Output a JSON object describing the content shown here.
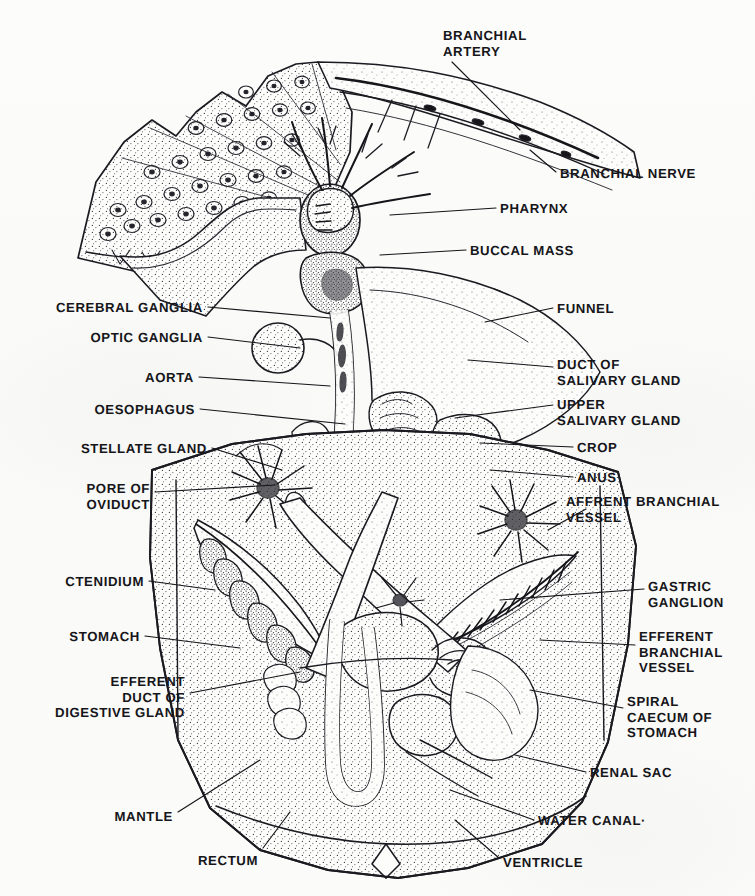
{
  "figure": {
    "kind": "anatomical-line-drawing",
    "style": "stippled pen-and-ink scan",
    "background_color": "#fbfbfa",
    "ink_color": "#15151a"
  },
  "labels": [
    {
      "id": "branchial-artery",
      "text": "BRANCHIAL\nARTERY",
      "x": 443,
      "y": 28,
      "align": "l"
    },
    {
      "id": "branchial-nerve",
      "text": "BRANCHIAL NERVE",
      "x": 560,
      "y": 166,
      "align": "l"
    },
    {
      "id": "pharynx",
      "text": "PHARYNX",
      "x": 500,
      "y": 201,
      "align": "l"
    },
    {
      "id": "buccal-mass",
      "text": "BUCCAL MASS",
      "x": 470,
      "y": 243,
      "align": "l"
    },
    {
      "id": "cerebral-ganglia",
      "text": "CEREBRAL GANGLIA",
      "x": 203,
      "y": 300,
      "align": "r"
    },
    {
      "id": "optic-ganglia",
      "text": "OPTIC GANGLIA",
      "x": 203,
      "y": 330,
      "align": "r"
    },
    {
      "id": "funnel",
      "text": "FUNNEL",
      "x": 557,
      "y": 301,
      "align": "l"
    },
    {
      "id": "duct-salivary",
      "text": "DUCT OF\nSALIVARY GLAND",
      "x": 557,
      "y": 357,
      "align": "l"
    },
    {
      "id": "aorta",
      "text": "AORTA",
      "x": 194,
      "y": 370,
      "align": "r"
    },
    {
      "id": "upper-salivary",
      "text": "UPPER\nSALIVARY GLAND",
      "x": 557,
      "y": 397,
      "align": "l"
    },
    {
      "id": "oesophagus",
      "text": "OESOPHAGUS",
      "x": 195,
      "y": 402,
      "align": "r"
    },
    {
      "id": "crop",
      "text": "CROP",
      "x": 577,
      "y": 440,
      "align": "l"
    },
    {
      "id": "stellate-gland",
      "text": "STELLATE GLAND",
      "x": 207,
      "y": 441,
      "align": "r"
    },
    {
      "id": "anus",
      "text": "ANUS",
      "x": 577,
      "y": 470,
      "align": "l"
    },
    {
      "id": "pore-of-oviduct",
      "text": "PORE OF\nOVIDUCT",
      "x": 150,
      "y": 481,
      "align": "r"
    },
    {
      "id": "afferent-branchial",
      "text": "AFFRENT BRANCHIAL\nVESSEL",
      "x": 566,
      "y": 494,
      "align": "l"
    },
    {
      "id": "ctenidium",
      "text": "CTENIDIUM",
      "x": 144,
      "y": 574,
      "align": "r"
    },
    {
      "id": "gastric-ganglion",
      "text": "GASTRIC\nGANGLION",
      "x": 648,
      "y": 579,
      "align": "l"
    },
    {
      "id": "stomach",
      "text": "STOMACH",
      "x": 140,
      "y": 629,
      "align": "r"
    },
    {
      "id": "efferent-branchial",
      "text": "EFFERENT\nBRANCHIAL\nVESSEL",
      "x": 639,
      "y": 629,
      "align": "l"
    },
    {
      "id": "efferent-duct",
      "text": "EFFERENT\nDUCT OF\nDIGESTIVE GLAND",
      "x": 185,
      "y": 674,
      "align": "r"
    },
    {
      "id": "spiral-caecum",
      "text": "SPIRAL\nCAECUM OF\nSTOMACH",
      "x": 627,
      "y": 694,
      "align": "l"
    },
    {
      "id": "renal-sac",
      "text": "RENAL SAC",
      "x": 590,
      "y": 765,
      "align": "l"
    },
    {
      "id": "mantle",
      "text": "MANTLE",
      "x": 173,
      "y": 809,
      "align": "r"
    },
    {
      "id": "water-canal",
      "text": "WATER CANAL·",
      "x": 538,
      "y": 813,
      "align": "l"
    },
    {
      "id": "rectum",
      "text": "RECTUM",
      "x": 258,
      "y": 853,
      "align": "r"
    },
    {
      "id": "ventricle",
      "text": "VENTRICLE",
      "x": 503,
      "y": 855,
      "align": "l"
    }
  ],
  "leader_lines": [
    {
      "id": "leader-branchial-artery",
      "points": "452,62 520,130"
    },
    {
      "id": "leader-branchial-nerve",
      "points": "556,172 530,150"
    },
    {
      "id": "leader-pharynx",
      "points": "496,208 390,215"
    },
    {
      "id": "leader-buccal-mass",
      "points": "466,250 380,255"
    },
    {
      "id": "leader-cerebral-ganglia",
      "points": "208,307 330,318"
    },
    {
      "id": "leader-optic-ganglia",
      "points": "208,337 300,348"
    },
    {
      "id": "leader-funnel",
      "points": "553,308 485,322"
    },
    {
      "id": "leader-duct-salivary",
      "points": "553,367 468,360"
    },
    {
      "id": "leader-aorta",
      "points": "199,377 330,386"
    },
    {
      "id": "leader-upper-salivary",
      "points": "553,405 455,418"
    },
    {
      "id": "leader-oesophagus",
      "points": "200,409 345,424"
    },
    {
      "id": "leader-crop",
      "points": "573,447 480,443"
    },
    {
      "id": "leader-stellate-gland",
      "points": "212,448 282,470"
    },
    {
      "id": "leader-anus",
      "points": "573,477 490,470"
    },
    {
      "id": "leader-pore-oviduct",
      "points": "155,492 275,485"
    },
    {
      "id": "leader-afferent-branchial",
      "points": "586,509 548,530"
    },
    {
      "id": "leader-ctenidium",
      "points": "149,581 215,590"
    },
    {
      "id": "leader-gastric-ganglion",
      "points": "644,589 500,600"
    },
    {
      "id": "leader-stomach",
      "points": "145,636 240,648"
    },
    {
      "id": "leader-efferent-branchial",
      "points": "635,645 540,640"
    },
    {
      "id": "leader-efferent-duct",
      "points": "190,693 300,672"
    },
    {
      "id": "leader-spiral-caecum",
      "points": "623,708 530,690"
    },
    {
      "id": "leader-renal-sac",
      "points": "586,772 515,755"
    },
    {
      "id": "leader-mantle",
      "points": "178,812 260,760"
    },
    {
      "id": "leader-water-canal",
      "points": "534,820 450,790"
    },
    {
      "id": "leader-rectum",
      "points": "263,848 290,812"
    },
    {
      "id": "leader-ventricle",
      "points": "499,858 455,820"
    }
  ]
}
